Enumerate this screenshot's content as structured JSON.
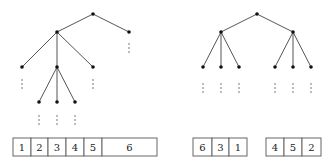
{
  "left_tree": {
    "nodes": [
      {
        "id": "root",
        "x": 93,
        "y": 14
      },
      {
        "id": "a",
        "x": 57,
        "y": 32
      },
      {
        "id": "b",
        "x": 129,
        "y": 32
      },
      {
        "id": "a1",
        "x": 22,
        "y": 67
      },
      {
        "id": "a2",
        "x": 57,
        "y": 67
      },
      {
        "id": "a3",
        "x": 93,
        "y": 67
      },
      {
        "id": "a2a",
        "x": 39,
        "y": 102
      },
      {
        "id": "a2b",
        "x": 57,
        "y": 102
      },
      {
        "id": "a2c",
        "x": 75,
        "y": 102
      }
    ],
    "edges": [
      [
        "root",
        "a"
      ],
      [
        "root",
        "b"
      ],
      [
        "a",
        "a1"
      ],
      [
        "a",
        "a2"
      ],
      [
        "a",
        "a3"
      ],
      [
        "a2",
        "a2a"
      ],
      [
        "a2",
        "a2b"
      ],
      [
        "a2",
        "a2c"
      ]
    ],
    "ellipses": [
      {
        "x": 129,
        "y": 44
      },
      {
        "x": 22,
        "y": 80
      },
      {
        "x": 93,
        "y": 80
      },
      {
        "x": 39,
        "y": 116
      },
      {
        "x": 57,
        "y": 116
      },
      {
        "x": 75,
        "y": 116
      }
    ],
    "array": {
      "y": 138,
      "h": 18,
      "cells": [
        {
          "x": 13,
          "w": 18,
          "label": "1"
        },
        {
          "x": 31,
          "w": 17,
          "label": "2"
        },
        {
          "x": 48,
          "w": 18,
          "label": "3"
        },
        {
          "x": 66,
          "w": 18,
          "label": "4"
        },
        {
          "x": 84,
          "w": 18,
          "label": "5"
        },
        {
          "x": 102,
          "w": 55,
          "label": "6"
        }
      ]
    }
  },
  "right_tree": {
    "nodes": [
      {
        "id": "root",
        "x": 257,
        "y": 14
      },
      {
        "id": "l",
        "x": 221,
        "y": 32
      },
      {
        "id": "r",
        "x": 293,
        "y": 32
      },
      {
        "id": "l1",
        "x": 203,
        "y": 67
      },
      {
        "id": "l2",
        "x": 221,
        "y": 67
      },
      {
        "id": "l3",
        "x": 239,
        "y": 67
      },
      {
        "id": "r1",
        "x": 275,
        "y": 67
      },
      {
        "id": "r2",
        "x": 293,
        "y": 67
      },
      {
        "id": "r3",
        "x": 311,
        "y": 67
      }
    ],
    "edges": [
      [
        "root",
        "l"
      ],
      [
        "root",
        "r"
      ],
      [
        "l",
        "l1"
      ],
      [
        "l",
        "l2"
      ],
      [
        "l",
        "l3"
      ],
      [
        "r",
        "r1"
      ],
      [
        "r",
        "r2"
      ],
      [
        "r",
        "r3"
      ]
    ],
    "ellipses": [
      {
        "x": 203,
        "y": 84
      },
      {
        "x": 221,
        "y": 84
      },
      {
        "x": 239,
        "y": 84
      },
      {
        "x": 275,
        "y": 84
      },
      {
        "x": 293,
        "y": 84
      },
      {
        "x": 311,
        "y": 84
      }
    ],
    "arrays": [
      {
        "y": 138,
        "h": 18,
        "cells": [
          {
            "x": 193,
            "w": 19,
            "label": "6"
          },
          {
            "x": 212,
            "w": 17,
            "label": "3"
          },
          {
            "x": 229,
            "w": 18,
            "label": "1"
          }
        ]
      },
      {
        "y": 138,
        "h": 18,
        "cells": [
          {
            "x": 266,
            "w": 18,
            "label": "4"
          },
          {
            "x": 284,
            "w": 18,
            "label": "5"
          },
          {
            "x": 302,
            "w": 19,
            "label": "2"
          }
        ]
      }
    ]
  }
}
